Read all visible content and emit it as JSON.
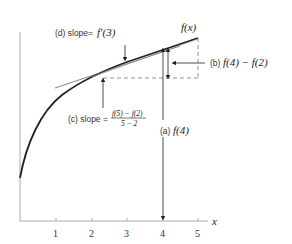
{
  "diagram": {
    "curve_label": "f(x)",
    "x_axis_label": "x",
    "x_ticks": [
      "1",
      "2",
      "3",
      "4",
      "5"
    ],
    "annotations": {
      "a": {
        "tag": "(a)",
        "expr": "f(4)"
      },
      "b": {
        "tag": "(b)",
        "expr": "f(4) − f(2)"
      },
      "c": {
        "tag": "(c) slope =",
        "numerator": "f(5) − f(2)",
        "denominator": "5 − 2"
      },
      "d": {
        "tag": "(d) slope=",
        "expr": "f′(3)"
      }
    }
  },
  "colors": {
    "curve": "#222222",
    "axis": "#999999",
    "line": "#555555"
  }
}
